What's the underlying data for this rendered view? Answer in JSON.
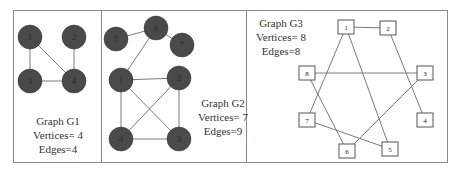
{
  "colors": {
    "frame": "#8a8a8a",
    "edge": "#7a7a7a",
    "node_fill": "#4a4a4a",
    "node_text": "#222222",
    "box_stroke": "#555555",
    "label_text": "#333333"
  },
  "panels": [
    {
      "id": "G1",
      "title": "Graph G1",
      "vertices_label": "Vertices= 4",
      "edges_label": "Edges=4",
      "node_style": "filled-circle",
      "nodes": [
        {
          "id": "1",
          "x": 30,
          "y": 37
        },
        {
          "id": "2",
          "x": 74,
          "y": 37
        },
        {
          "id": "3",
          "x": 30,
          "y": 81
        },
        {
          "id": "4",
          "x": 74,
          "y": 81
        }
      ],
      "edges": [
        [
          "1",
          "3"
        ],
        [
          "1",
          "4"
        ],
        [
          "2",
          "4"
        ],
        [
          "3",
          "4"
        ]
      ]
    },
    {
      "id": "G2",
      "title": "Graph G2",
      "vertices_label": "Vertices= 7",
      "edges_label": "Edges=9",
      "node_style": "filled-circle",
      "nodes": [
        {
          "id": "5",
          "x": 116,
          "y": 39
        },
        {
          "id": "6",
          "x": 156,
          "y": 28
        },
        {
          "id": "7",
          "x": 182,
          "y": 45
        },
        {
          "id": "1",
          "x": 121,
          "y": 80
        },
        {
          "id": "2",
          "x": 179,
          "y": 78
        },
        {
          "id": "4",
          "x": 121,
          "y": 139
        },
        {
          "id": "3",
          "x": 179,
          "y": 139
        }
      ],
      "edges": [
        [
          "5",
          "6"
        ],
        [
          "6",
          "7"
        ],
        [
          "6",
          "1"
        ],
        [
          "1",
          "2"
        ],
        [
          "1",
          "4"
        ],
        [
          "1",
          "3"
        ],
        [
          "2",
          "4"
        ],
        [
          "2",
          "3"
        ],
        [
          "4",
          "3"
        ]
      ]
    },
    {
      "id": "G3",
      "title": "Graph G3",
      "vertices_label": "Vertices= 8",
      "edges_label": "Edges=8",
      "node_style": "square-box",
      "nodes": [
        {
          "id": "1",
          "x": 346,
          "y": 27
        },
        {
          "id": "2",
          "x": 388,
          "y": 28
        },
        {
          "id": "8",
          "x": 307,
          "y": 73
        },
        {
          "id": "3",
          "x": 425,
          "y": 73
        },
        {
          "id": "7",
          "x": 307,
          "y": 120
        },
        {
          "id": "4",
          "x": 425,
          "y": 120
        },
        {
          "id": "6",
          "x": 347,
          "y": 151
        },
        {
          "id": "5",
          "x": 390,
          "y": 149
        }
      ],
      "edges": [
        [
          "1",
          "2"
        ],
        [
          "1",
          "7"
        ],
        [
          "1",
          "5"
        ],
        [
          "2",
          "4"
        ],
        [
          "8",
          "3"
        ],
        [
          "8",
          "6"
        ],
        [
          "3",
          "6"
        ],
        [
          "7",
          "5"
        ]
      ]
    }
  ]
}
